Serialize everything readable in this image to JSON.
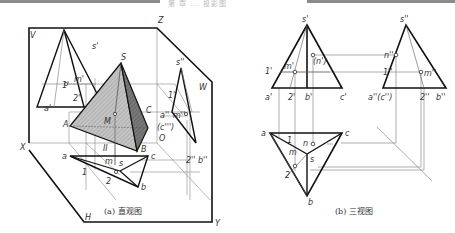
{
  "header": {
    "left_bar_color": "#8a8a8a",
    "middle_text": "第 章 ... 投影图"
  },
  "figure_a": {
    "caption": "(a) 直观图",
    "planes": {
      "V": "V",
      "W": "W",
      "H": "H"
    },
    "axes": {
      "X": "X",
      "Y": "Y",
      "Z": "Z",
      "O": "O"
    },
    "solid_labels": {
      "S": "S",
      "A": "A",
      "B": "B",
      "C": "C",
      "M": "M",
      "II": "II"
    },
    "v_projection_labels": {
      "s": "s'",
      "a": "a'",
      "p1": "1'",
      "p2": "2'",
      "m": "m'"
    },
    "w_projection_labels": {
      "s": "s''",
      "p1": "1''",
      "a": "a''",
      "m": "m''",
      "c": "(c''')",
      "p2": "2''",
      "b": "b''"
    },
    "h_projection_labels": {
      "a": "a",
      "c": "c",
      "b": "b",
      "s": "s",
      "m": "m",
      "p1": "1",
      "p2": "2"
    }
  },
  "figure_b": {
    "caption": "(b) 三视图",
    "front_view_labels": {
      "s": "s'",
      "p1": "1'",
      "m": "m'",
      "n": "(n')",
      "a": "a'",
      "p2": "2'",
      "b": "b'",
      "c": "c'"
    },
    "side_view_labels": {
      "s": "s''",
      "n": "n''",
      "p1": "1''",
      "m": "m''",
      "a": "a''(c'')",
      "p2": "2''",
      "b": "b''"
    },
    "top_view_labels": {
      "a": "a",
      "c": "c",
      "p1": "1",
      "n": "n",
      "m": "m",
      "s": "s",
      "p2": "2",
      "b": "b"
    }
  },
  "colors": {
    "line": "#111111",
    "thin_line": "#777777",
    "face_light": "#b8b8b8",
    "face_dark": "#6e6e6e"
  }
}
